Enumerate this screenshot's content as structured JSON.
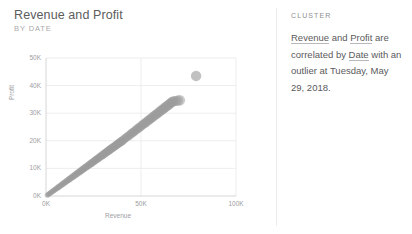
{
  "visual": {
    "title": "Revenue and Profit",
    "subtitle": "BY DATE"
  },
  "insight": {
    "header": "CLUSTER",
    "text_parts": {
      "field_x": "Revenue",
      "conjunction": " and ",
      "field_y": "Profit",
      "middle": " are correlated by ",
      "field_date": "Date",
      "tail": " with an outlier at Tuesday, May 29, 2018."
    },
    "full_text": "Revenue and Profit are correlated by Date with an outlier at Tuesday, May 29, 2018."
  },
  "colors": {
    "dot": "#9b9b9b",
    "grid": "#ededee",
    "axis": "#d6d6d7",
    "text": "#5a5a5c",
    "muted": "#9d9d9f",
    "divider": "#ececed"
  },
  "chart_data": {
    "type": "scatter",
    "title": "Revenue and Profit",
    "subtitle": "BY DATE",
    "xlabel": "Revenue",
    "ylabel": "Profit",
    "xlim": [
      0,
      100000
    ],
    "ylim": [
      0,
      50000
    ],
    "xticks": [
      "0K",
      "50K",
      "100K"
    ],
    "xtick_values": [
      0,
      50000,
      100000
    ],
    "yticks": [
      "0K",
      "10K",
      "20K",
      "30K",
      "40K",
      "50K"
    ],
    "ytick_values": [
      0,
      10000,
      20000,
      30000,
      40000,
      50000
    ],
    "grid": true,
    "legend": false,
    "series": [
      {
        "name": "Revenue and Profit by Date",
        "points": [
          [
            700,
            300
          ],
          [
            1100,
            500
          ],
          [
            1500,
            700
          ],
          [
            1900,
            900
          ],
          [
            2300,
            1100
          ],
          [
            2700,
            1300
          ],
          [
            3100,
            1500
          ],
          [
            3500,
            1700
          ],
          [
            3900,
            1900
          ],
          [
            4300,
            2100
          ],
          [
            4700,
            2300
          ],
          [
            5100,
            2500
          ],
          [
            5500,
            2700
          ],
          [
            5900,
            2900
          ],
          [
            6300,
            3100
          ],
          [
            6700,
            3300
          ],
          [
            7100,
            3500
          ],
          [
            7500,
            3700
          ],
          [
            7900,
            3900
          ],
          [
            8300,
            4100
          ],
          [
            8700,
            4300
          ],
          [
            9100,
            4500
          ],
          [
            9500,
            4700
          ],
          [
            9900,
            4900
          ],
          [
            10300,
            5100
          ],
          [
            10700,
            5300
          ],
          [
            11100,
            5500
          ],
          [
            11500,
            5700
          ],
          [
            11900,
            5900
          ],
          [
            12300,
            6100
          ],
          [
            12700,
            6300
          ],
          [
            13100,
            6500
          ],
          [
            13500,
            6700
          ],
          [
            13900,
            6900
          ],
          [
            14300,
            7100
          ],
          [
            14700,
            7300
          ],
          [
            15100,
            7500
          ],
          [
            15500,
            7700
          ],
          [
            15900,
            7900
          ],
          [
            16300,
            8100
          ],
          [
            16700,
            8300
          ],
          [
            17100,
            8500
          ],
          [
            17500,
            8700
          ],
          [
            17900,
            8900
          ],
          [
            18300,
            9100
          ],
          [
            18700,
            9300
          ],
          [
            19100,
            9500
          ],
          [
            19500,
            9700
          ],
          [
            19900,
            9900
          ],
          [
            20300,
            10100
          ],
          [
            20700,
            10300
          ],
          [
            21100,
            10500
          ],
          [
            21500,
            10700
          ],
          [
            21900,
            10900
          ],
          [
            22300,
            11100
          ],
          [
            22700,
            11300
          ],
          [
            23100,
            11500
          ],
          [
            23500,
            11700
          ],
          [
            23900,
            11900
          ],
          [
            24300,
            12100
          ],
          [
            24700,
            12300
          ],
          [
            25100,
            12500
          ],
          [
            25500,
            12700
          ],
          [
            25900,
            12900
          ],
          [
            26300,
            13100
          ],
          [
            26700,
            13300
          ],
          [
            27100,
            13500
          ],
          [
            27500,
            13700
          ],
          [
            27900,
            13900
          ],
          [
            28300,
            14100
          ],
          [
            28700,
            14300
          ],
          [
            29100,
            14500
          ],
          [
            29500,
            14700
          ],
          [
            29900,
            14900
          ],
          [
            30300,
            15100
          ],
          [
            30700,
            15300
          ],
          [
            31100,
            15500
          ],
          [
            31500,
            15700
          ],
          [
            31900,
            15900
          ],
          [
            32300,
            16100
          ],
          [
            32700,
            16300
          ],
          [
            33100,
            16500
          ],
          [
            33500,
            16700
          ],
          [
            33900,
            16900
          ],
          [
            34300,
            17100
          ],
          [
            34700,
            17300
          ],
          [
            35100,
            17500
          ],
          [
            35500,
            17700
          ],
          [
            35900,
            17900
          ],
          [
            36300,
            18100
          ],
          [
            36700,
            18300
          ],
          [
            37100,
            18500
          ],
          [
            37500,
            18700
          ],
          [
            37900,
            18900
          ],
          [
            38300,
            19100
          ],
          [
            38700,
            19300
          ],
          [
            39100,
            19500
          ],
          [
            39500,
            19700
          ],
          [
            39900,
            19900
          ],
          [
            40300,
            20100
          ],
          [
            40900,
            20400
          ],
          [
            41500,
            20800
          ],
          [
            42100,
            21100
          ],
          [
            42700,
            21400
          ],
          [
            43300,
            21700
          ],
          [
            43900,
            22000
          ],
          [
            44500,
            22400
          ],
          [
            45100,
            22700
          ],
          [
            45700,
            23000
          ],
          [
            46300,
            23300
          ],
          [
            46900,
            23600
          ],
          [
            47500,
            24000
          ],
          [
            48100,
            24300
          ],
          [
            48700,
            24600
          ],
          [
            49300,
            24900
          ],
          [
            49900,
            25200
          ],
          [
            50500,
            25600
          ],
          [
            51100,
            25900
          ],
          [
            51700,
            26200
          ],
          [
            52300,
            26500
          ],
          [
            52900,
            26800
          ],
          [
            53500,
            27200
          ],
          [
            54100,
            27500
          ],
          [
            54700,
            27800
          ],
          [
            55300,
            28100
          ],
          [
            55900,
            28400
          ],
          [
            56500,
            28800
          ],
          [
            57100,
            29100
          ],
          [
            57700,
            29400
          ],
          [
            58300,
            29700
          ],
          [
            58900,
            30000
          ],
          [
            59500,
            30400
          ],
          [
            60100,
            30700
          ],
          [
            60700,
            31000
          ],
          [
            61300,
            31300
          ],
          [
            61900,
            31600
          ],
          [
            62500,
            32000
          ],
          [
            63100,
            32300
          ],
          [
            63700,
            32600
          ],
          [
            64300,
            32900
          ],
          [
            64900,
            33200
          ],
          [
            65500,
            33600
          ],
          [
            66100,
            33900
          ],
          [
            66700,
            34200
          ],
          [
            67300,
            34400
          ],
          [
            68500,
            34500
          ],
          [
            69500,
            34600
          ],
          [
            70500,
            34700
          ]
        ]
      }
    ],
    "outlier": {
      "label": "Tuesday, May 29, 2018",
      "x": 79000,
      "y": 43500
    },
    "annotation": "Revenue and Profit are correlated by Date with an outlier at Tuesday, May 29, 2018."
  }
}
